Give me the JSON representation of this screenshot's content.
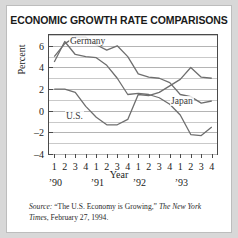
{
  "figure": {
    "title": "ECONOMIC GROWTH RATE COMPARISONS",
    "background_color": "#ffffff",
    "page_background_color": "#d8d8d8",
    "border_color": "#bdbdbd"
  },
  "source_note": {
    "label": "Source:",
    "article": "“The U.S. Economy is Growing,”",
    "publication": "The New York Times",
    "date": ", February 27, 1994."
  },
  "axes": {
    "ylabel": "Percent",
    "xlabel": "Year",
    "yticks": [
      6,
      4,
      2,
      0,
      -2,
      -4
    ],
    "ytick_labels": [
      "6",
      "4",
      "2",
      "0",
      "–2",
      "–4"
    ],
    "ylim": [
      -4,
      7
    ],
    "quarter_labels": [
      "1",
      "2",
      "3",
      "4",
      "1",
      "2",
      "3",
      "4",
      "1",
      "2",
      "3",
      "4",
      "1",
      "2",
      "3",
      "4"
    ],
    "year_labels": [
      "’90",
      "’91",
      "’92",
      "’93"
    ],
    "grid": true,
    "legend": "inline-labels"
  },
  "chart_data": {
    "type": "line",
    "title": "ECONOMIC GROWTH RATE COMPARISONS",
    "xlabel": "Year",
    "ylabel": "Percent",
    "ylim": [
      -4,
      7
    ],
    "grid": true,
    "legend_position": "inline",
    "x": [
      "'90 Q1",
      "'90 Q2",
      "'90 Q3",
      "'90 Q4",
      "'91 Q1",
      "'91 Q2",
      "'91 Q3",
      "'91 Q4",
      "'92 Q1",
      "'92 Q2",
      "'92 Q3",
      "'92 Q4",
      "'93 Q1",
      "'93 Q2",
      "'93 Q3",
      "'93 Q4"
    ],
    "categories": [
      "1",
      "2",
      "3",
      "4",
      "1",
      "2",
      "3",
      "4",
      "1",
      "2",
      "3",
      "4",
      "1",
      "2",
      "3",
      "4"
    ],
    "series": [
      {
        "name": "Germany",
        "color": "#6e6e6e",
        "label_position": {
          "x": 62,
          "y": 30
        },
        "values": [
          4.5,
          6.4,
          5.2,
          5.0,
          4.9,
          4.2,
          3.0,
          1.5,
          1.6,
          1.5,
          1.2,
          0.6,
          -0.4,
          -2.2,
          -2.3,
          -1.5
        ]
      },
      {
        "name": "U.S.",
        "color": "#6e6e6e",
        "label_position": {
          "x": 58,
          "y": 105
        },
        "values": [
          2.0,
          2.0,
          1.7,
          0.4,
          -0.6,
          -1.3,
          -1.3,
          -0.8,
          1.5,
          1.4,
          1.7,
          2.3,
          2.9,
          4.0,
          3.1,
          3.0
        ]
      },
      {
        "name": "Japan",
        "color": "#6e6e6e",
        "label_position": {
          "x": 163,
          "y": 90
        },
        "values": [
          5.0,
          6.2,
          6.8,
          6.8,
          6.1,
          5.6,
          6.0,
          5.0,
          3.4,
          3.1,
          3.0,
          2.6,
          1.5,
          1.3,
          0.7,
          0.9
        ]
      }
    ]
  }
}
